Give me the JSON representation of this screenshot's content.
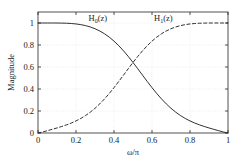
{
  "figure": {
    "background_color": "#ffffff",
    "axes_color": "#262626",
    "grid_color": "#d2d2d2"
  },
  "axes": {
    "xlabel": "ω/π",
    "ylabel": "Magnitude",
    "xlim": [
      0,
      1
    ],
    "ylim": [
      0,
      1.1
    ],
    "xticks": [
      0,
      0.2,
      0.4,
      0.6,
      0.8,
      1
    ],
    "yticks": [
      0,
      0.2,
      0.4,
      0.6,
      0.8,
      1
    ],
    "xticklabels": [
      "0",
      "0.2",
      "0.4",
      "0.6",
      "0.8",
      "1"
    ],
    "yticklabels": [
      "0",
      "0.2",
      "0.4",
      "0.6",
      "0.8",
      "1"
    ],
    "grid": true,
    "box": true
  },
  "annotations": [
    {
      "name": "h0-curve-label",
      "base": "H",
      "subscript": "0",
      "suffix": "(z)",
      "x": 0.315,
      "y": 1.02
    },
    {
      "name": "h1-curve-label",
      "base": "H",
      "subscript": "1",
      "suffix": "(z)",
      "x": 0.66,
      "y": 1.02
    }
  ],
  "chart_data": {
    "type": "line",
    "title": "",
    "xlabel": "ω/π",
    "ylabel": "Magnitude",
    "xlim": [
      0,
      1
    ],
    "ylim": [
      0,
      1.1
    ],
    "grid": true,
    "legend_position": "inline-annotation",
    "x": [
      0,
      0.025,
      0.05,
      0.075,
      0.1,
      0.125,
      0.15,
      0.175,
      0.2,
      0.225,
      0.25,
      0.275,
      0.3,
      0.325,
      0.35,
      0.375,
      0.4,
      0.425,
      0.45,
      0.475,
      0.5,
      0.525,
      0.55,
      0.575,
      0.6,
      0.625,
      0.65,
      0.675,
      0.7,
      0.725,
      0.75,
      0.775,
      0.8,
      0.825,
      0.85,
      0.875,
      0.9,
      0.925,
      0.95,
      0.975,
      1
    ],
    "series": [
      {
        "name": "H0(z)",
        "label": "H_0(z)",
        "style": "solid",
        "color": "#1a1a1a",
        "values": [
          1.0,
          1.0,
          1.0,
          0.9999,
          0.9997,
          0.9991,
          0.9978,
          0.9954,
          0.9914,
          0.9852,
          0.9763,
          0.9641,
          0.948,
          0.9275,
          0.9021,
          0.8714,
          0.8353,
          0.7938,
          0.7472,
          0.6961,
          0.6414,
          0.5843,
          0.5261,
          0.4683,
          0.4122,
          0.359,
          0.3096,
          0.2646,
          0.2244,
          0.1891,
          0.1585,
          0.1322,
          0.1097,
          0.0905,
          0.0739,
          0.0593,
          0.046,
          0.0334,
          0.0212,
          0.0094,
          0.0
        ]
      },
      {
        "name": "H1(z)",
        "label": "H_1(z)",
        "style": "dashed",
        "color": "#1a1a1a",
        "values": [
          0.0,
          0.0094,
          0.0212,
          0.0334,
          0.046,
          0.0593,
          0.0739,
          0.0905,
          0.1097,
          0.1322,
          0.1585,
          0.1891,
          0.2244,
          0.2646,
          0.3096,
          0.359,
          0.4122,
          0.4683,
          0.5261,
          0.5843,
          0.6414,
          0.6961,
          0.7472,
          0.7938,
          0.8353,
          0.8714,
          0.9021,
          0.9275,
          0.948,
          0.9641,
          0.9763,
          0.9852,
          0.9914,
          0.9954,
          0.9978,
          0.9991,
          0.9997,
          0.9999,
          1.0,
          1.0,
          1.0
        ]
      }
    ],
    "annotations": [
      {
        "text": "H_0(z)",
        "x": 0.315,
        "y": 1.02
      },
      {
        "text": "H_1(z)",
        "x": 0.66,
        "y": 1.02
      }
    ],
    "notes": {
      "crossover_x": 0.5,
      "crossover_y": 0.707
    }
  }
}
